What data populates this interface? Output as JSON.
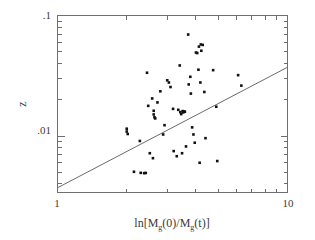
{
  "chart_data": {
    "type": "scatter",
    "title": "",
    "xlabel": "ln[M_g(0)/M_g(t)]",
    "xlabel_parts": {
      "prefix": "ln[M",
      "sub1": "g",
      "mid": "(0)/M",
      "sub2": "g",
      "suffix": "(t)]"
    },
    "ylabel": "z",
    "xscale": "log",
    "yscale": "log",
    "xlim": [
      1,
      10
    ],
    "ylim": [
      0.0034,
      0.1
    ],
    "xticks": [
      1,
      10
    ],
    "xtick_labels": [
      "1",
      "10"
    ],
    "yticks": [
      0.01,
      0.1
    ],
    "ytick_labels": [
      ".01",
      ".1"
    ],
    "grid": false,
    "legend": "none",
    "marker": "square",
    "marker_color": "#111111",
    "line_color": "#6b6b6b",
    "frame_color": "#6e6e6e",
    "fit_line": {
      "label": "regression line",
      "x": [
        1.0,
        10.0
      ],
      "y": [
        0.00372,
        0.0372
      ],
      "slope_loglog": 1.0
    },
    "points": [
      {
        "x": 2.0,
        "y": 0.0109
      },
      {
        "x": 2.0,
        "y": 0.0115
      },
      {
        "x": 2.02,
        "y": 0.0104
      },
      {
        "x": 2.15,
        "y": 0.00505
      },
      {
        "x": 2.3,
        "y": 0.00495
      },
      {
        "x": 2.38,
        "y": 0.00492
      },
      {
        "x": 2.42,
        "y": 0.00494
      },
      {
        "x": 2.28,
        "y": 0.0091
      },
      {
        "x": 2.52,
        "y": 0.0072
      },
      {
        "x": 2.6,
        "y": 0.00655
      },
      {
        "x": 2.45,
        "y": 0.0335
      },
      {
        "x": 2.48,
        "y": 0.0178
      },
      {
        "x": 2.62,
        "y": 0.0151
      },
      {
        "x": 2.62,
        "y": 0.0162
      },
      {
        "x": 2.64,
        "y": 0.0143
      },
      {
        "x": 2.66,
        "y": 0.014
      },
      {
        "x": 2.58,
        "y": 0.0205
      },
      {
        "x": 2.72,
        "y": 0.019
      },
      {
        "x": 2.8,
        "y": 0.0235
      },
      {
        "x": 2.88,
        "y": 0.0103
      },
      {
        "x": 2.92,
        "y": 0.0123
      },
      {
        "x": 3.0,
        "y": 0.029
      },
      {
        "x": 3.05,
        "y": 0.0278
      },
      {
        "x": 3.1,
        "y": 0.0255
      },
      {
        "x": 3.18,
        "y": 0.0168
      },
      {
        "x": 3.2,
        "y": 0.0075
      },
      {
        "x": 3.3,
        "y": 0.0068
      },
      {
        "x": 3.35,
        "y": 0.0165
      },
      {
        "x": 3.42,
        "y": 0.0158
      },
      {
        "x": 3.45,
        "y": 0.0152
      },
      {
        "x": 3.5,
        "y": 0.0161
      },
      {
        "x": 3.52,
        "y": 0.0157
      },
      {
        "x": 3.55,
        "y": 0.016
      },
      {
        "x": 3.58,
        "y": 0.0159
      },
      {
        "x": 3.4,
        "y": 0.0385
      },
      {
        "x": 3.48,
        "y": 0.0072
      },
      {
        "x": 3.62,
        "y": 0.0082
      },
      {
        "x": 3.7,
        "y": 0.0695
      },
      {
        "x": 3.72,
        "y": 0.0268
      },
      {
        "x": 3.78,
        "y": 0.031
      },
      {
        "x": 3.8,
        "y": 0.0225
      },
      {
        "x": 3.85,
        "y": 0.0118
      },
      {
        "x": 3.9,
        "y": 0.0103
      },
      {
        "x": 3.95,
        "y": 0.0088
      },
      {
        "x": 4.0,
        "y": 0.0493
      },
      {
        "x": 4.05,
        "y": 0.0488
      },
      {
        "x": 4.12,
        "y": 0.0552
      },
      {
        "x": 4.2,
        "y": 0.0575
      },
      {
        "x": 4.28,
        "y": 0.057
      },
      {
        "x": 4.22,
        "y": 0.051
      },
      {
        "x": 4.1,
        "y": 0.0355
      },
      {
        "x": 4.18,
        "y": 0.0278
      },
      {
        "x": 4.35,
        "y": 0.0232
      },
      {
        "x": 4.4,
        "y": 0.0096
      },
      {
        "x": 4.15,
        "y": 0.006
      },
      {
        "x": 4.75,
        "y": 0.0352
      },
      {
        "x": 4.9,
        "y": 0.0175
      },
      {
        "x": 4.95,
        "y": 0.0062
      },
      {
        "x": 6.1,
        "y": 0.032
      },
      {
        "x": 6.3,
        "y": 0.0262
      }
    ]
  },
  "axes": {
    "x_label_left": "1",
    "x_label_right": "10",
    "y_label_top": ".1",
    "y_label_bottom": ".01",
    "y_axis_title": "z"
  }
}
